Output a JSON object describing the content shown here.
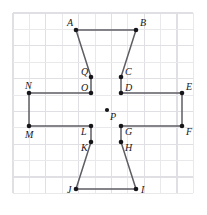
{
  "figure": {
    "width": 207,
    "height": 215,
    "colors": {
      "background": "#ffffff",
      "grid": "#e9e9ec",
      "grid_major": "#e0e0e4",
      "edge": "#5d5d63",
      "dot": "#16161a",
      "label": "#16161a"
    },
    "grid": {
      "visible": true,
      "origin_x": 13,
      "origin_y": 13,
      "cell": 16.4,
      "cols": 11,
      "rows": 11
    },
    "vertices": [
      {
        "id": "A",
        "label": "A",
        "x": 76,
        "y": 30,
        "label_dx": -9,
        "label_dy": -4,
        "on_path": true
      },
      {
        "id": "B",
        "label": "B",
        "x": 136,
        "y": 30,
        "label_dx": 4,
        "label_dy": -4,
        "on_path": true
      },
      {
        "id": "C",
        "label": "C",
        "x": 121,
        "y": 77,
        "label_dx": 4,
        "label_dy": -2,
        "on_path": true
      },
      {
        "id": "D",
        "label": "D",
        "x": 121,
        "y": 93,
        "label_dx": 4,
        "label_dy": -2,
        "on_path": true
      },
      {
        "id": "E",
        "label": "E",
        "x": 182,
        "y": 93,
        "label_dx": 4,
        "label_dy": -3,
        "on_path": true
      },
      {
        "id": "F",
        "label": "F",
        "x": 182,
        "y": 126,
        "label_dx": 4,
        "label_dy": 9,
        "on_path": true
      },
      {
        "id": "G",
        "label": "G",
        "x": 121,
        "y": 126,
        "label_dx": 4,
        "label_dy": 9,
        "on_path": true
      },
      {
        "id": "H",
        "label": "H",
        "x": 121,
        "y": 142,
        "label_dx": 4,
        "label_dy": 9,
        "on_path": true
      },
      {
        "id": "I",
        "label": "I",
        "x": 136,
        "y": 189,
        "label_dx": 5,
        "label_dy": 4,
        "on_path": true
      },
      {
        "id": "J",
        "label": "J",
        "x": 76,
        "y": 189,
        "label_dx": -9,
        "label_dy": 4,
        "on_path": true
      },
      {
        "id": "K",
        "label": "K",
        "x": 91,
        "y": 142,
        "label_dx": -10,
        "label_dy": 9,
        "on_path": true
      },
      {
        "id": "L",
        "label": "L",
        "x": 91,
        "y": 126,
        "label_dx": -10,
        "label_dy": 9,
        "on_path": true
      },
      {
        "id": "M",
        "label": "M",
        "x": 29,
        "y": 126,
        "label_dx": -4,
        "label_dy": 12,
        "on_path": true
      },
      {
        "id": "N",
        "label": "N",
        "x": 29,
        "y": 93,
        "label_dx": -4,
        "label_dy": -4,
        "on_path": true
      },
      {
        "id": "O",
        "label": "O",
        "x": 91,
        "y": 93,
        "label_dx": -10,
        "label_dy": -2,
        "on_path": true
      },
      {
        "id": "Q",
        "label": "Q",
        "x": 91,
        "y": 77,
        "label_dx": -10,
        "label_dy": -2,
        "on_path": true
      },
      {
        "id": "P",
        "label": "P",
        "x": 107,
        "y": 110,
        "label_dx": 3,
        "label_dy": 10,
        "on_path": false
      }
    ],
    "edges": [
      {
        "from": "A",
        "to": "B"
      },
      {
        "from": "B",
        "to": "C"
      },
      {
        "from": "C",
        "to": "D"
      },
      {
        "from": "D",
        "to": "E"
      },
      {
        "from": "E",
        "to": "F"
      },
      {
        "from": "F",
        "to": "G"
      },
      {
        "from": "G",
        "to": "H"
      },
      {
        "from": "H",
        "to": "I"
      },
      {
        "from": "I",
        "to": "J"
      },
      {
        "from": "J",
        "to": "K"
      },
      {
        "from": "K",
        "to": "L"
      },
      {
        "from": "L",
        "to": "M"
      },
      {
        "from": "M",
        "to": "N"
      },
      {
        "from": "N",
        "to": "O"
      },
      {
        "from": "O",
        "to": "Q"
      },
      {
        "from": "Q",
        "to": "A"
      }
    ],
    "dot_radius": 2.3,
    "center_dot_radius": 2.1
  }
}
